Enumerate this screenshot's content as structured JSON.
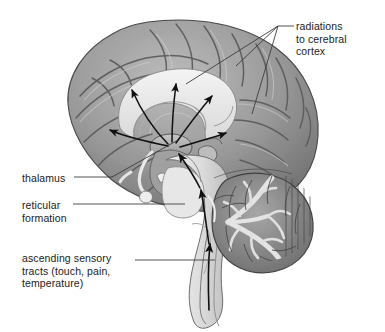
{
  "figure": {
    "background_color": "#ffffff",
    "text_color": "#1b1b1b",
    "leader_line_color": "#3c3c3c",
    "arrow_color": "#101010"
  },
  "labels": {
    "radiations": "radiations\nto cerebral\ncortex",
    "thalamus": "thalamus",
    "reticular": "reticular\nformation",
    "ascending": "ascending sensory\ntracts (touch, pain,\ntemperature)"
  },
  "anatomy": {
    "cerebral_cortex": {
      "name": "cerebral cortex",
      "fill": "#9b9b9b",
      "outline": "#4e4e4e"
    },
    "corpus_callosum": {
      "name": "corpus callosum",
      "fill": "#ececec",
      "outline": "#8a8a8a"
    },
    "thalamus": {
      "name": "thalamus",
      "fill": "#b4b4b4",
      "outline": "#555555"
    },
    "cerebellum": {
      "name": "cerebellum",
      "fill": "#8e8e8e",
      "arbor_vitae_fill": "#e2e2e2",
      "outline": "#3f3f3f"
    },
    "brainstem": {
      "name": "brainstem",
      "fill": "#dcdcdc",
      "outline": "#707070"
    },
    "spinal_cord": {
      "name": "spinal cord",
      "fill": "#e4e4e4",
      "outline": "#6b6b6b"
    }
  },
  "pathways": {
    "radiation_arrows_count": 5,
    "ascending_arrows_count": 3,
    "description": "Curved arrows fan out from the thalamus to the cerebral cortex; a long arrow ascends through the spinal cord and brainstem to the thalamus."
  }
}
